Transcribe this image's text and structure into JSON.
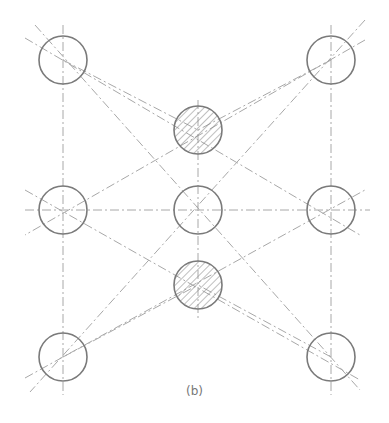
{
  "caption": "(b)",
  "colors": {
    "circle_stroke": "#7a7a7a",
    "centerline": "#a8a8a8",
    "hatch": "#8a8a8a",
    "background": "#ffffff"
  },
  "circles": [
    {
      "id": "top-left",
      "cx": 63,
      "cy": 60,
      "r": 24,
      "hatched": false
    },
    {
      "id": "top-right",
      "cx": 331,
      "cy": 60,
      "r": 24,
      "hatched": false
    },
    {
      "id": "upper-center",
      "cx": 198,
      "cy": 130,
      "r": 24,
      "hatched": true
    },
    {
      "id": "mid-left",
      "cx": 63,
      "cy": 210,
      "r": 24,
      "hatched": false
    },
    {
      "id": "mid-center",
      "cx": 198,
      "cy": 210,
      "r": 24,
      "hatched": false
    },
    {
      "id": "mid-right",
      "cx": 331,
      "cy": 210,
      "r": 24,
      "hatched": false
    },
    {
      "id": "lower-center",
      "cx": 198,
      "cy": 285,
      "r": 24,
      "hatched": true
    },
    {
      "id": "bottom-left",
      "cx": 63,
      "cy": 357,
      "r": 24,
      "hatched": false
    },
    {
      "id": "bottom-right",
      "cx": 331,
      "cy": 357,
      "r": 24,
      "hatched": false
    }
  ],
  "centerlines": [
    {
      "x1": 63,
      "y1": 25,
      "x2": 63,
      "y2": 395
    },
    {
      "x1": 198,
      "y1": 100,
      "x2": 198,
      "y2": 320
    },
    {
      "x1": 331,
      "y1": 25,
      "x2": 331,
      "y2": 395
    },
    {
      "x1": 25,
      "y1": 210,
      "x2": 370,
      "y2": 210
    },
    {
      "x1": 35,
      "y1": 25,
      "x2": 360,
      "y2": 390
    },
    {
      "x1": 25,
      "y1": 38,
      "x2": 360,
      "y2": 235
    },
    {
      "x1": 365,
      "y1": 20,
      "x2": 30,
      "y2": 392
    },
    {
      "x1": 365,
      "y1": 40,
      "x2": 25,
      "y2": 235
    },
    {
      "x1": 25,
      "y1": 190,
      "x2": 360,
      "y2": 380
    },
    {
      "x1": 25,
      "y1": 378,
      "x2": 365,
      "y2": 190
    },
    {
      "x1": 63,
      "y1": 60,
      "x2": 198,
      "y2": 130
    },
    {
      "x1": 331,
      "y1": 60,
      "x2": 198,
      "y2": 130
    },
    {
      "x1": 63,
      "y1": 357,
      "x2": 198,
      "y2": 285
    },
    {
      "x1": 331,
      "y1": 357,
      "x2": 198,
      "y2": 285
    }
  ]
}
